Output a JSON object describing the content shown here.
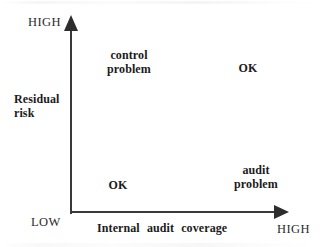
{
  "diagram": {
    "type": "two-by-two-matrix",
    "background_color": "#ffffff",
    "axis_color": "#3a3a3a",
    "text_color": "#1b1b1b"
  },
  "y_axis": {
    "title": "Residual\nrisk",
    "high_label": "HIGH",
    "low_label": "LOW"
  },
  "x_axis": {
    "title": "Internal audit coverage",
    "high_label": "HIGH"
  },
  "cells": {
    "upper_left": "control\nproblem",
    "upper_right": "OK",
    "lower_left": "OK",
    "lower_right": "audit\nproblem"
  }
}
